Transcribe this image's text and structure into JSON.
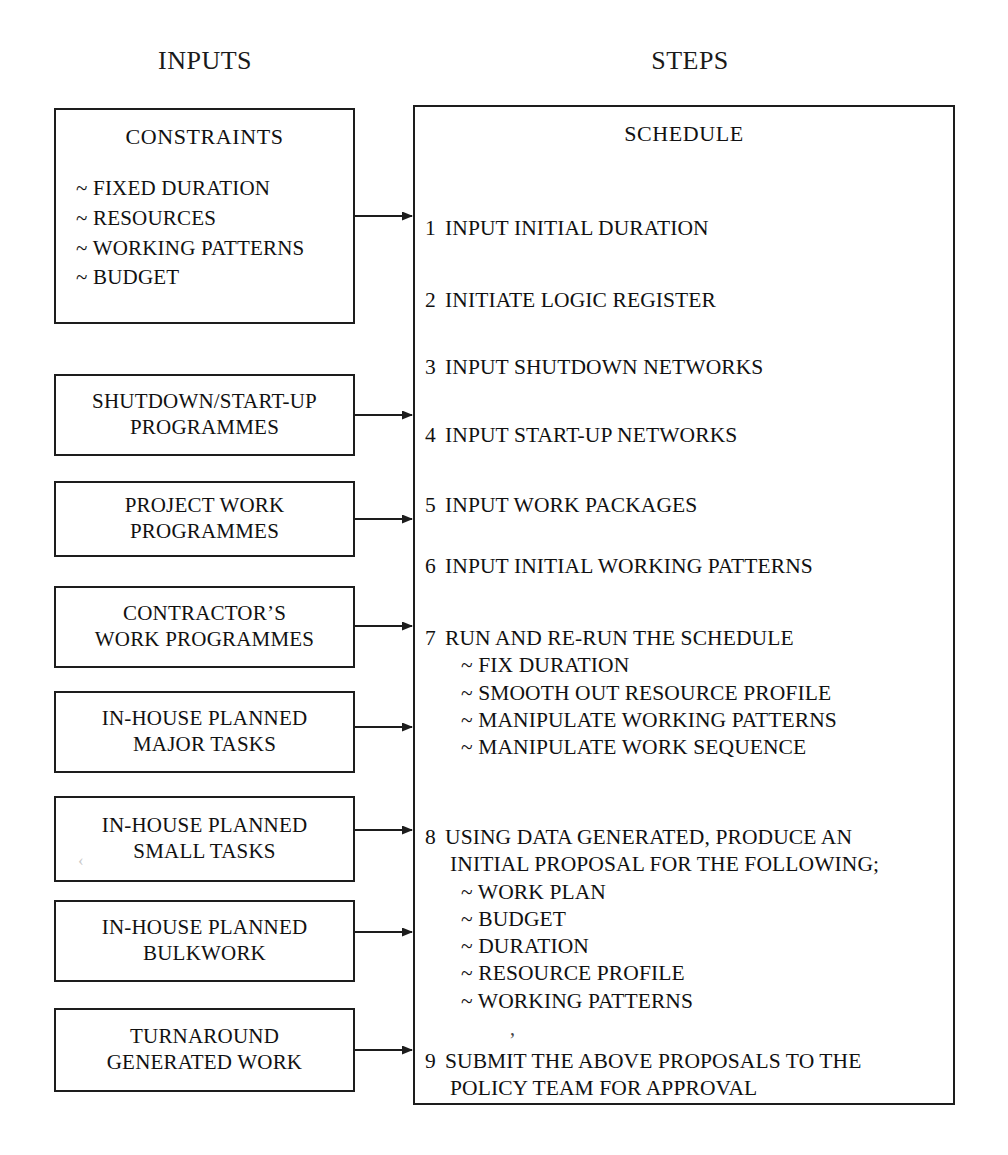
{
  "page": {
    "top_fragment": "",
    "headers": [
      {
        "id": "inputs",
        "label": "INPUTS"
      },
      {
        "id": "steps",
        "label": "STEPS"
      }
    ]
  },
  "inputs": {
    "constraints": {
      "title": "CONSTRAINTS",
      "items": [
        "~ FIXED DURATION",
        "~ RESOURCES",
        "~ WORKING PATTERNS",
        "~ BUDGET"
      ]
    },
    "boxes": [
      {
        "id": "shutdown-startup-programmes",
        "lines": [
          "SHUTDOWN/START-UP",
          "PROGRAMMES"
        ]
      },
      {
        "id": "project-work-programmes",
        "lines": [
          "PROJECT WORK",
          "PROGRAMMES"
        ]
      },
      {
        "id": "contractors-work-programmes",
        "lines": [
          "CONTRACTOR’S",
          "WORK PROGRAMMES"
        ]
      },
      {
        "id": "in-house-planned-major-tasks",
        "lines": [
          "IN-HOUSE PLANNED",
          "MAJOR TASKS"
        ]
      },
      {
        "id": "in-house-planned-small-tasks",
        "lines": [
          "IN-HOUSE PLANNED",
          "SMALL TASKS"
        ]
      },
      {
        "id": "in-house-planned-bulkwork",
        "lines": [
          "IN-HOUSE PLANNED",
          "BULKWORK"
        ]
      },
      {
        "id": "turnaround-generated-work",
        "lines": [
          "TURNAROUND",
          "GENERATED WORK"
        ]
      }
    ]
  },
  "schedule": {
    "title": "SCHEDULE",
    "steps": [
      {
        "num": "1",
        "text": "INPUT INITIAL DURATION",
        "cont": "",
        "sub": []
      },
      {
        "num": "2",
        "text": "INITIATE LOGIC REGISTER",
        "cont": "",
        "sub": []
      },
      {
        "num": "3",
        "text": "INPUT SHUTDOWN NETWORKS",
        "cont": "",
        "sub": []
      },
      {
        "num": "4",
        "text": "INPUT START-UP NETWORKS",
        "cont": "",
        "sub": []
      },
      {
        "num": "5",
        "text": "INPUT WORK PACKAGES",
        "cont": "",
        "sub": []
      },
      {
        "num": "6",
        "text": "INPUT INITIAL WORKING PATTERNS",
        "cont": "",
        "sub": []
      },
      {
        "num": "7",
        "text": "RUN AND RE-RUN THE SCHEDULE",
        "cont": "",
        "sub": [
          "~ FIX DURATION",
          "~ SMOOTH OUT RESOURCE PROFILE",
          "~ MANIPULATE WORKING PATTERNS",
          "~ MANIPULATE WORK SEQUENCE"
        ]
      },
      {
        "num": "8",
        "text": "USING DATA GENERATED, PRODUCE AN",
        "cont": "INITIAL PROPOSAL FOR THE FOLLOWING;",
        "sub": [
          "~ WORK PLAN",
          "~ BUDGET",
          "~ DURATION",
          "~ RESOURCE PROFILE",
          "~ WORKING PATTERNS"
        ]
      },
      {
        "num": "9",
        "text": "SUBMIT THE ABOVE PROPOSALS TO THE",
        "cont": "POLICY TEAM FOR APPROVAL",
        "sub": []
      }
    ],
    "stray_mark": "’"
  },
  "artifacts": {
    "faint_chevron": "‹"
  },
  "colors": {
    "ink": "#1d1d1d",
    "paper": "#ffffff",
    "faint": "#d8d8d8"
  }
}
